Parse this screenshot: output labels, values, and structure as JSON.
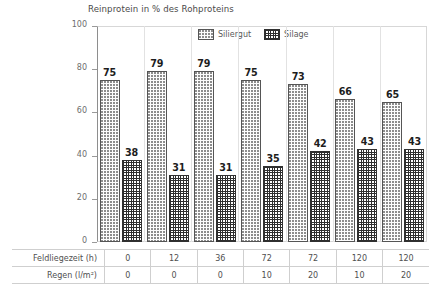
{
  "chart_data": {
    "type": "bar",
    "title": "Reinprotein in % des Rohproteins",
    "xlabel": "",
    "ylabel": "",
    "ylim": [
      0,
      100
    ],
    "yticks": [
      0,
      20,
      40,
      60,
      80,
      100
    ],
    "grid": false,
    "legend_position": "top-center",
    "categories": [
      "0 / 0",
      "12 / 0",
      "36 / 0",
      "72 / 10",
      "72 / 20",
      "120 / 10",
      "120 / 20"
    ],
    "series": [
      {
        "name": "Siliergut",
        "pattern": "dotted",
        "values": [
          75,
          79,
          79,
          75,
          73,
          66,
          65
        ]
      },
      {
        "name": "Silage",
        "pattern": "cross-hatch",
        "values": [
          38,
          31,
          31,
          35,
          42,
          43,
          43
        ]
      }
    ]
  },
  "legend": {
    "items": [
      {
        "label": "Siliergut",
        "pattern": "siliergut"
      },
      {
        "label": "Silage",
        "pattern": "silage"
      }
    ]
  },
  "table": {
    "rows": [
      {
        "header": "Feldliegezeit (h)",
        "values": [
          "0",
          "12",
          "36",
          "72",
          "72",
          "120",
          "120"
        ]
      },
      {
        "header": "Regen (l/m²)",
        "values": [
          "0",
          "0",
          "0",
          "10",
          "20",
          "10",
          "20"
        ]
      }
    ]
  },
  "axis": {
    "y_tick_labels": [
      "100",
      "80",
      "60",
      "40",
      "20",
      "0"
    ]
  },
  "colors": {
    "text": "#3b3b3b",
    "value_label": "#1d1d1d",
    "bar_outline": "#555555",
    "silage_ink": "#2e2e2e",
    "siliergut_ink": "#8d8d8d",
    "frame": "#d7d7d7",
    "table_border": "#cfcfcf"
  }
}
